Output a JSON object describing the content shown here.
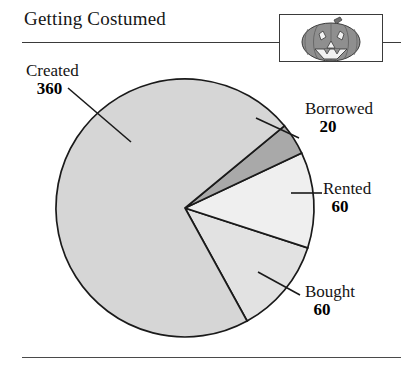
{
  "header": {
    "title": "Getting Costumed",
    "thumbnail_icon": "jack-o-lantern-icon"
  },
  "chart_data": {
    "type": "pie",
    "title": "Getting Costumed",
    "categories": [
      "Created",
      "Borrowed",
      "Rented",
      "Bought"
    ],
    "values": [
      360,
      20,
      60,
      60
    ],
    "total": 500,
    "labels": [
      {
        "name": "Created",
        "value": "360"
      },
      {
        "name": "Borrowed",
        "value": "20"
      },
      {
        "name": "Rented",
        "value": "60"
      },
      {
        "name": "Bought",
        "value": "60"
      }
    ],
    "colors": [
      "#d6d6d6",
      "#a9a9a9",
      "#efefef",
      "#e2e2e2"
    ],
    "outline_color": "#1a1a1a",
    "legend": "callout-labels",
    "grid": false,
    "xlabel": "",
    "ylabel": ""
  },
  "colors": {
    "rule": "#3a3a3a",
    "text": "#141414",
    "background": "#ffffff",
    "pumpkin_body": "#8f8f8f",
    "pumpkin_stem": "#6f6f6f",
    "pumpkin_face": "#f2f2f2"
  }
}
